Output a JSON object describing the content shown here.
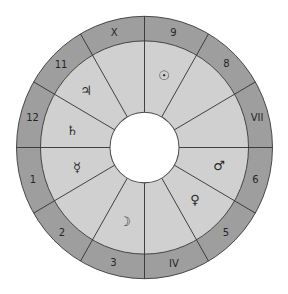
{
  "chart": {
    "houses": [
      {
        "number": 10,
        "label": "X"
      },
      {
        "number": 9,
        "label": "9"
      },
      {
        "number": 8,
        "label": "8"
      },
      {
        "number": 7,
        "label": "VII"
      },
      {
        "number": 6,
        "label": "6"
      },
      {
        "number": 5,
        "label": "5"
      },
      {
        "number": 4,
        "label": "IV"
      },
      {
        "number": 3,
        "label": "3"
      },
      {
        "number": 2,
        "label": "2"
      },
      {
        "number": 1,
        "label": "1"
      },
      {
        "number": 12,
        "label": "12"
      },
      {
        "number": 11,
        "label": "11"
      }
    ],
    "planets": [
      {
        "name": "Sun",
        "glyph": "☉",
        "house": 9
      },
      {
        "name": "Jupiter",
        "glyph": "♃",
        "house": 11
      },
      {
        "name": "Saturn",
        "glyph": "♄",
        "house": 12
      },
      {
        "name": "Mercury",
        "glyph": "☿",
        "house": 1
      },
      {
        "name": "Moon",
        "glyph": "☽",
        "house": 3
      },
      {
        "name": "Venus",
        "glyph": "♀",
        "house": 5
      },
      {
        "name": "Mars",
        "glyph": "♂",
        "house": 6
      }
    ]
  },
  "colors": {
    "outer_ring": "#9e9e9e",
    "inner_ring": "#d0d0d0",
    "lines": "#333333",
    "center": "#ffffff"
  }
}
